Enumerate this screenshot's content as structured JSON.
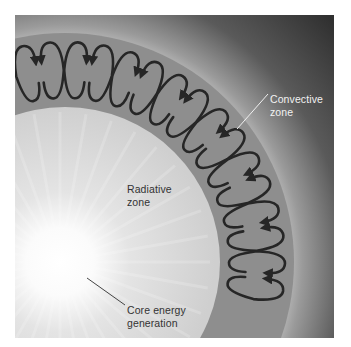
{
  "diagram": {
    "labels": {
      "convective": [
        "Convective",
        "zone"
      ],
      "radiative": [
        "Radiative",
        "zone"
      ],
      "core": [
        "Core energy",
        "generation"
      ]
    },
    "geometry": {
      "center": [
        65,
        262
      ],
      "radiative_radius": 155,
      "convective_outer_radius": 229
    },
    "colors": {
      "space": "#3a3a3a",
      "halo": "#b4b4b4",
      "convective_zone": "#8e8e8e",
      "radiative_zone": "#d2d2d2",
      "core_glow": "#ffffff",
      "cell_arrows": "#262626",
      "convective_leader": "#f0f0f0",
      "core_leader": "#444444"
    },
    "convective_cells": {
      "count_pairs": 8,
      "direction": "paired counter-rotating loops with arrowheads"
    }
  }
}
